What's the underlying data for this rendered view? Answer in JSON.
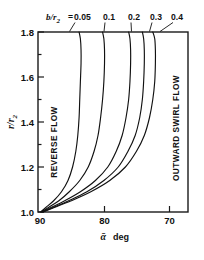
{
  "chart_data": {
    "type": "line",
    "title": "",
    "xlabel": "ā  deg",
    "xlabel_symbol": "ᾱ",
    "xlabel_unit": "deg",
    "ylabel": "r/r₂",
    "ylabel_symbol": "r/r",
    "ylabel_sub": "2",
    "xlim": [
      90,
      67
    ],
    "ylim": [
      1.0,
      1.8
    ],
    "x_reversed": true,
    "grid": false,
    "xticks": [
      90,
      80,
      70
    ],
    "xtick_labels": [
      "90",
      "80",
      "70"
    ],
    "yticks": [
      1.0,
      1.2,
      1.4,
      1.6,
      1.8
    ],
    "ytick_labels": [
      "1.0",
      "1.2",
      "1.4",
      "1.6",
      "1.8"
    ],
    "legend_title": "b/r",
    "legend_title_sub": "2",
    "legend_equals": "=",
    "legend_position": "top",
    "series": [
      {
        "name": "0.05",
        "label": "0.05",
        "x": [
          89.6,
          88.8,
          87.6,
          86.4,
          85.4,
          84.7,
          84.2,
          83.9,
          83.7,
          83.6,
          83.5,
          83.4,
          83.4,
          83.5,
          83.7
        ],
        "y": [
          1.0,
          1.02,
          1.05,
          1.09,
          1.14,
          1.2,
          1.27,
          1.34,
          1.42,
          1.5,
          1.58,
          1.66,
          1.72,
          1.77,
          1.8
        ]
      },
      {
        "name": "0.1",
        "label": "0.1",
        "x": [
          89.5,
          88.4,
          86.8,
          85.2,
          83.6,
          82.3,
          81.4,
          80.8,
          80.4,
          80.1,
          79.9,
          79.8,
          79.8,
          79.9,
          80.1
        ],
        "y": [
          1.0,
          1.02,
          1.05,
          1.09,
          1.14,
          1.2,
          1.27,
          1.34,
          1.42,
          1.5,
          1.58,
          1.66,
          1.72,
          1.77,
          1.8
        ]
      },
      {
        "name": "0.2",
        "label": "0.2",
        "x": [
          89.4,
          88.0,
          85.9,
          83.5,
          81.2,
          79.3,
          78.0,
          77.1,
          76.5,
          76.1,
          75.9,
          75.8,
          75.8,
          75.9,
          76.1
        ],
        "y": [
          1.0,
          1.02,
          1.05,
          1.09,
          1.14,
          1.2,
          1.27,
          1.34,
          1.42,
          1.5,
          1.58,
          1.66,
          1.72,
          1.77,
          1.8
        ]
      },
      {
        "name": "0.3",
        "label": "0.3",
        "x": [
          89.3,
          87.7,
          85.3,
          82.5,
          79.9,
          77.7,
          76.2,
          75.1,
          74.4,
          74.0,
          73.8,
          73.7,
          73.7,
          73.8,
          74.0
        ],
        "y": [
          1.0,
          1.02,
          1.05,
          1.09,
          1.14,
          1.2,
          1.27,
          1.34,
          1.42,
          1.5,
          1.58,
          1.66,
          1.72,
          1.77,
          1.8
        ]
      },
      {
        "name": "0.4",
        "label": "0.4",
        "x": [
          89.2,
          87.5,
          84.9,
          81.9,
          79.0,
          76.6,
          74.9,
          73.7,
          72.9,
          72.4,
          72.1,
          72.0,
          72.0,
          72.1,
          72.4
        ],
        "y": [
          1.0,
          1.02,
          1.05,
          1.09,
          1.14,
          1.2,
          1.27,
          1.34,
          1.42,
          1.5,
          1.58,
          1.66,
          1.72,
          1.77,
          1.8
        ]
      }
    ],
    "annotations": [
      {
        "text": "REVERSE FLOW",
        "region": "left",
        "rotation": -90
      },
      {
        "text": "OUTWARD SWIRL FLOW",
        "region": "right",
        "rotation": -90
      }
    ]
  }
}
